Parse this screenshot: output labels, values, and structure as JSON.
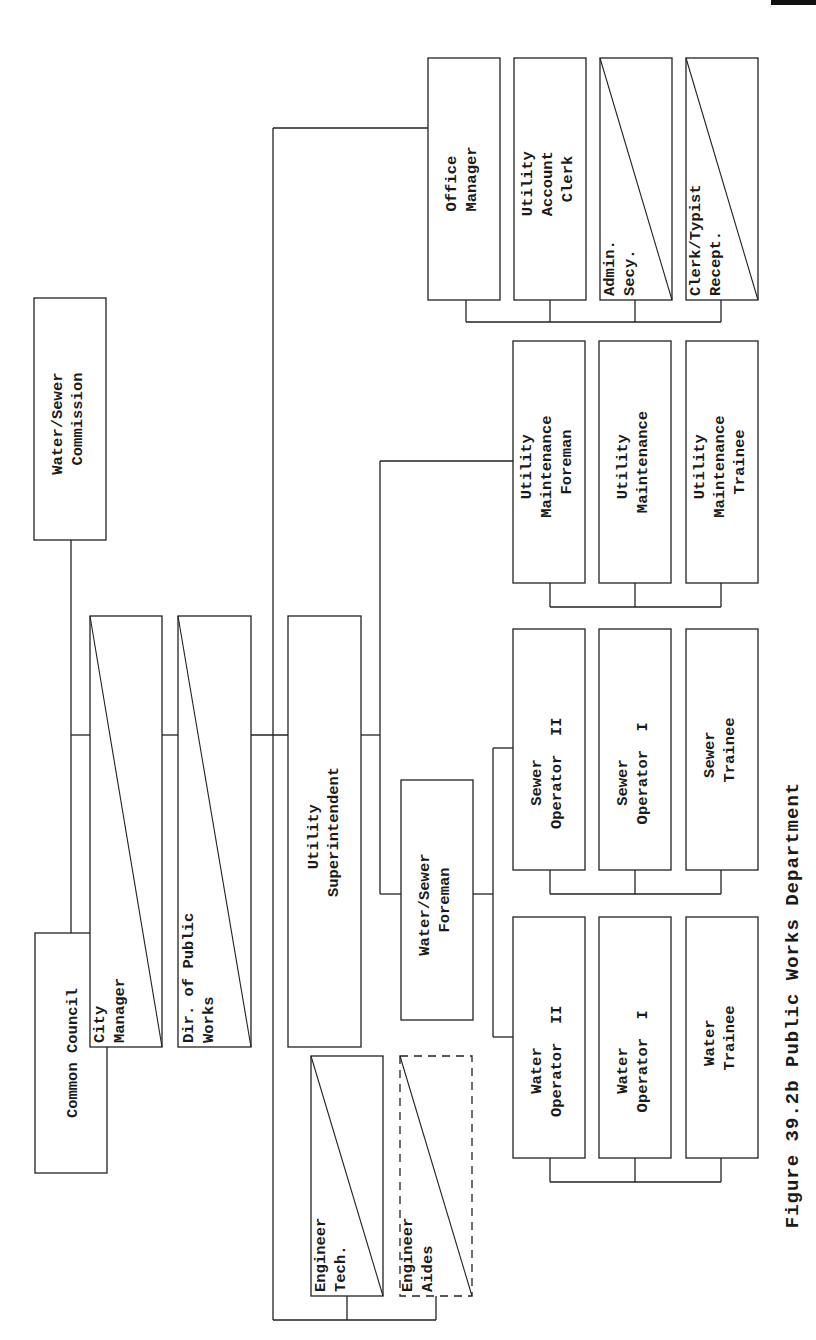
{
  "caption": "Figure 39.2b Public Works Department",
  "nodes": {
    "water_sewer_commission": [
      "Water/Sewer",
      "Commission"
    ],
    "common_council": [
      "Common Council"
    ],
    "city_manager": [
      "City",
      "Manager"
    ],
    "dir_public_works": [
      "Dir. of Public",
      "Works"
    ],
    "utility_superintendent": [
      "Utility",
      "Superintendent"
    ],
    "office_manager": [
      "Office",
      "Manager"
    ],
    "utility_account_clerk": [
      "Utility",
      "Account",
      "Clerk"
    ],
    "admin_secy": [
      "Admin.",
      "Secy."
    ],
    "clerk_typist_recept": [
      "Clerk/Typist",
      "Recept."
    ],
    "utility_maintenance_foreman": [
      "Utility",
      "Maintenance",
      "Foreman"
    ],
    "utility_maintenance": [
      "Utility",
      "Maintenance"
    ],
    "utility_maintenance_trainee": [
      "Utility",
      "Maintenance",
      "Trainee"
    ],
    "water_sewer_foreman": [
      "Water/Sewer",
      "Foreman"
    ],
    "sewer_operator_ii": [
      "Sewer",
      "Operator  II"
    ],
    "sewer_operator_i": [
      "Sewer",
      "Operator  I"
    ],
    "sewer_trainee": [
      "Sewer",
      "Trainee"
    ],
    "water_operator_ii": [
      "Water",
      "Operator  II"
    ],
    "water_operator_i": [
      "Water",
      "Operator  I"
    ],
    "water_trainee": [
      "Water",
      "Trainee"
    ],
    "engineer_tech": [
      "Engineer",
      "Tech."
    ],
    "engineer_aides": [
      "Engineer",
      "Aides"
    ]
  },
  "legend_notes": {
    "diagonal_box": "position shared/part-time (diagonal slash)",
    "dashed_box": "position proposed/optional (dashed outline)"
  },
  "colors": {
    "line": "#222222",
    "text": "#1a1a1a",
    "background": "#ffffff"
  }
}
